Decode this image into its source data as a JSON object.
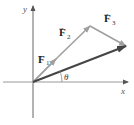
{
  "diagram": {
    "axes": {
      "x_label": "x",
      "y_label": "y",
      "color": "#555555"
    },
    "vectors": [
      {
        "id": "F1",
        "symbol": "F",
        "subscript": "1",
        "color": "#a0a0a0"
      },
      {
        "id": "F2",
        "symbol": "F",
        "subscript": "2",
        "color": "#a0a0a0"
      },
      {
        "id": "F3",
        "symbol": "F",
        "subscript": "3",
        "color": "#a0a0a0"
      },
      {
        "id": "R",
        "symbol": "",
        "subscript": "",
        "color": "#444444"
      }
    ],
    "angle_label": "θ"
  }
}
